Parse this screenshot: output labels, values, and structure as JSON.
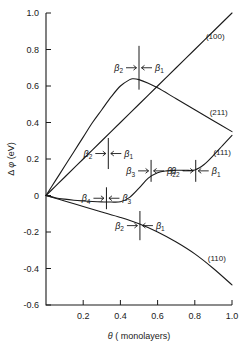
{
  "chart_data": {
    "type": "line",
    "title": "",
    "xlabel": "θ ( monolayers)",
    "ylabel": "Δ φ (eV)",
    "xlim": [
      0.0,
      1.0
    ],
    "ylim": [
      -0.6,
      1.0
    ],
    "grid": false,
    "legend": "inline-curve-labels",
    "xticks": [
      "0.2",
      "0.4",
      "0.6",
      "0.8",
      "1.0"
    ],
    "xtick_values": [
      0.2,
      0.4,
      0.6,
      0.8,
      1.0
    ],
    "yticks": [
      "1.0",
      "0.8",
      "0.6",
      "0.4",
      "0.2",
      "0",
      "-0.2",
      "-0.4",
      "-0.6"
    ],
    "ytick_values": [
      1.0,
      0.8,
      0.6,
      0.4,
      0.2,
      0,
      -0.2,
      -0.4,
      -0.6
    ],
    "series": [
      {
        "name": "(100)",
        "label": "(100)",
        "label_x": 0.86,
        "label_y": 0.86,
        "x": [
          0.0,
          0.05,
          0.1,
          0.2,
          0.3,
          0.4,
          0.5,
          0.6,
          0.7,
          0.8,
          0.9,
          1.0
        ],
        "y": [
          0.0,
          0.05,
          0.1,
          0.2,
          0.3,
          0.4,
          0.5,
          0.6,
          0.7,
          0.8,
          0.9,
          1.0
        ]
      },
      {
        "name": "(211)",
        "label": "(211)",
        "label_x": 0.88,
        "label_y": 0.44,
        "x": [
          0.0,
          0.05,
          0.1,
          0.15,
          0.2,
          0.25,
          0.3,
          0.35,
          0.4,
          0.45,
          0.47,
          0.5,
          0.55,
          0.6,
          0.7,
          0.8,
          0.9,
          1.0
        ],
        "y": [
          0.0,
          0.08,
          0.16,
          0.24,
          0.32,
          0.4,
          0.47,
          0.54,
          0.6,
          0.635,
          0.64,
          0.635,
          0.615,
          0.59,
          0.53,
          0.47,
          0.41,
          0.35
        ]
      },
      {
        "name": "(111)",
        "label": "(111)",
        "label_x": 0.9,
        "label_y": 0.22,
        "x": [
          0.0,
          0.05,
          0.1,
          0.15,
          0.2,
          0.25,
          0.3,
          0.35,
          0.4,
          0.45,
          0.5,
          0.55,
          0.6,
          0.65,
          0.7,
          0.75,
          0.8,
          0.85,
          0.9,
          0.95,
          1.0
        ],
        "y": [
          0.0,
          -0.012,
          -0.02,
          -0.026,
          -0.03,
          -0.033,
          -0.035,
          -0.036,
          -0.034,
          -0.01,
          0.04,
          0.095,
          0.125,
          0.135,
          0.138,
          0.138,
          0.14,
          0.17,
          0.22,
          0.275,
          0.33
        ]
      },
      {
        "name": "(110)",
        "label": "(110)",
        "label_x": 0.87,
        "label_y": -0.36,
        "x": [
          0.0,
          0.05,
          0.1,
          0.2,
          0.3,
          0.4,
          0.5,
          0.6,
          0.7,
          0.8,
          0.9,
          1.0
        ],
        "y": [
          0.0,
          -0.015,
          -0.03,
          -0.06,
          -0.09,
          -0.12,
          -0.155,
          -0.2,
          -0.255,
          -0.32,
          -0.4,
          -0.49
        ]
      }
    ],
    "annotations": [
      {
        "id": "ann-100-peak",
        "on_series": "(211)",
        "boundary_x": 0.5,
        "left_label": "β",
        "left_sub": "2",
        "right_label": "β",
        "right_sub": "1",
        "tick_top_y": 0.82,
        "tick_bottom_y": 0.58
      },
      {
        "id": "ann-211-mid",
        "on_series": "(211)",
        "boundary_x": 0.335,
        "left_label": "β",
        "left_sub": "2",
        "right_label": "β",
        "right_sub": "1",
        "tick_top_y": 0.315,
        "tick_bottom_y": 0.145
      },
      {
        "id": "ann-111-b4b3",
        "on_series": "(111)",
        "boundary_x": 0.325,
        "left_label": "β",
        "left_sub": "4",
        "right_label": "β",
        "right_sub": "3",
        "tick_top_y": 0.045,
        "tick_bottom_y": -0.075
      },
      {
        "id": "ann-111-b3b2",
        "on_series": "(111)",
        "boundary_x": 0.565,
        "left_label": "β",
        "left_sub": "3",
        "right_label": "β",
        "right_sub": "2",
        "tick_top_y": 0.195,
        "tick_bottom_y": 0.075
      },
      {
        "id": "ann-111-b2b1",
        "on_series": "(111)",
        "boundary_x": 0.805,
        "left_label": "β",
        "left_sub": "2",
        "right_label": "β",
        "right_sub": "1",
        "tick_top_y": 0.195,
        "tick_bottom_y": 0.075
      },
      {
        "id": "ann-110-b2b1",
        "on_series": "(110)",
        "boundary_x": 0.505,
        "left_label": "β",
        "left_sub": "2",
        "right_label": "β",
        "right_sub": "1",
        "tick_top_y": -0.085,
        "tick_bottom_y": -0.245
      }
    ]
  }
}
